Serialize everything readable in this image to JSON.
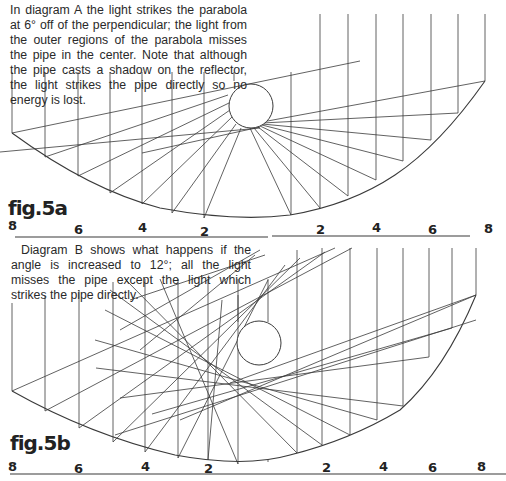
{
  "diagram_a": {
    "caption": "In diagram A the light strikes the parabola at 6° off of the perpendicular; the light from the outer regions of the parabola misses the pipe in the center. Note that although the pipe casts a shadow on the reflector, the light strikes the pipe directly so no energy is lost.",
    "label": "fig.5a",
    "angle_deg": 6,
    "scale_ticks": [
      "8",
      "6",
      "4",
      "2",
      "2",
      "4",
      "6",
      "8"
    ]
  },
  "diagram_b": {
    "caption": "Diagram B shows what happens if the angle is increased to 12°; all the light misses the pipe except the light which strikes the pipe directly.",
    "label": "fig.5b",
    "angle_deg": 12,
    "scale_ticks": [
      "8",
      "6",
      "4",
      "2",
      "2",
      "4",
      "6",
      "8"
    ]
  },
  "colors": {
    "ink": "#3a3a3a",
    "background": "#ffffff"
  }
}
